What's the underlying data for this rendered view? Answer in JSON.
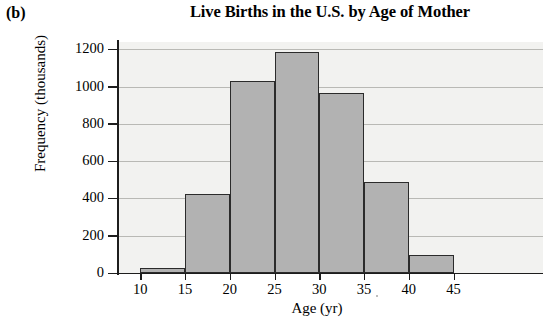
{
  "figure": {
    "panel_label": "(b)",
    "title": "Live Births in the U.S. by Age of Mother"
  },
  "chart_data": {
    "type": "bar",
    "title": "Live Births in the U.S. by Age of Mother",
    "subtitle": "",
    "xlabel": "Age (yr)",
    "ylabel": "Frequency (thousands)",
    "grid": true,
    "legend": false,
    "xlim": [
      7.5,
      55
    ],
    "ylim": [
      0,
      1240
    ],
    "xticks": [
      10,
      15,
      20,
      25,
      30,
      35,
      40,
      45
    ],
    "xtick_labels": [
      "10",
      "15",
      "20",
      "25",
      "30",
      "35",
      "40",
      "45"
    ],
    "yticks": [
      0,
      200,
      400,
      600,
      800,
      1000,
      1200
    ],
    "ytick_labels": [
      "0",
      "200",
      "400",
      "600",
      "800",
      "1000",
      "1200"
    ],
    "bin_width": 5,
    "bins": [
      {
        "range": "10-15",
        "left": 10,
        "right": 15,
        "value": 25
      },
      {
        "range": "15-20",
        "left": 15,
        "right": 20,
        "value": 425
      },
      {
        "range": "20-25",
        "left": 20,
        "right": 25,
        "value": 1030
      },
      {
        "range": "25-30",
        "left": 25,
        "right": 30,
        "value": 1185
      },
      {
        "range": "30-35",
        "left": 30,
        "right": 35,
        "value": 965
      },
      {
        "range": "35-40",
        "left": 35,
        "right": 40,
        "value": 490
      },
      {
        "range": "40-45",
        "left": 40,
        "right": 45,
        "value": 95
      }
    ],
    "categories": [
      "10-15",
      "15-20",
      "20-25",
      "25-30",
      "30-35",
      "35-40",
      "40-45"
    ],
    "values": [
      25,
      425,
      1030,
      1185,
      965,
      490,
      95
    ],
    "colors": {
      "bar_fill": "#b2b2b2",
      "bar_edge": "#2b2b2b",
      "plot_background": "#f2f2f0",
      "gridline": "#b9b9b5",
      "axis": "#1d1d1d",
      "text": "#000000"
    }
  }
}
